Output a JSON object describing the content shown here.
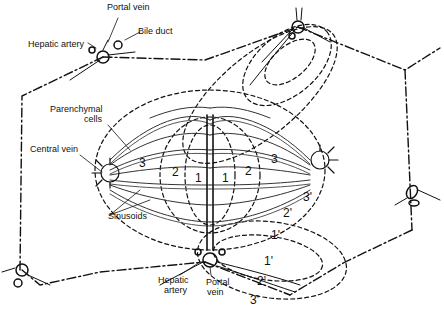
{
  "diagram": {
    "labels": {
      "portal_vein_top": "Portal vein",
      "hepatic_artery_top": "Hepatic artery",
      "bile_duct": "Bile duct",
      "parenchymal_cells_1": "Parenchymal",
      "parenchymal_cells_2": "cells",
      "central_vein": "Central vein",
      "sinusoids": "Sinusoids",
      "hepatic_artery_bottom_1": "Hepatic",
      "hepatic_artery_bottom_2": "artery",
      "portal_vein_bottom_1": "Portal",
      "portal_vein_bottom_2": "vein"
    },
    "zones": {
      "z1_left": "1",
      "z1_right": "1",
      "z2_left": "2",
      "z2_right": "2",
      "z3_left": "3",
      "z3_right": "3",
      "z1p_upper": "1'",
      "z1p_lower": "1'",
      "z2p_upper": "2'",
      "z2p_lower": "2'",
      "z3p_upper": "3'",
      "z3p_lower": "3'"
    },
    "colors": {
      "ink": "#111111",
      "background": "#ffffff"
    }
  }
}
